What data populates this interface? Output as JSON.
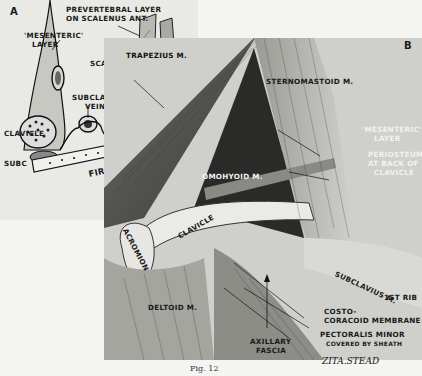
{
  "panel_a": {
    "letter": "A",
    "labels": {
      "prevertebral_1": "PREVERTEBRAL LAYER",
      "prevertebral_2": "ON SCALENUS  ANT.",
      "mesenteric_1": "'MESENTERIC'",
      "mesenteric_2": "LAYER",
      "scalenus_1": "SCALENUS",
      "scalenus_2": "MED.",
      "vein_1": "SUBCLAVIAN",
      "vein_2": "VEIN",
      "clavicle": "CLAVICLE",
      "subclavius": "SUBC",
      "first_rib": "FIRST  RIB",
      "artery": "SUBCLAVIAN A."
    }
  },
  "panel_b": {
    "letter": "B",
    "labels": {
      "trapezius": "TRAPEZIUS M.",
      "sternomastoid": "STERNOMASTOID M.",
      "omohyoid": "OMOHYOID M.",
      "mesenteric_1": "'MESENTERIC'",
      "mesenteric_2": "LAYER",
      "periosteum_1": "PERIOSTEUM",
      "periosteum_2": "AT BACK OF",
      "periosteum_3": "CLAVICLE",
      "acromion": "ACROMION",
      "clavicle": "CLAVICLE",
      "deltoid": "DELTOID M.",
      "axillary_1": "AXILLARY",
      "axillary_2": "FASCIA",
      "subclavius": "SUBCLAVIUS M.",
      "first_rib": "1ST RIB",
      "costo_1": "COSTO-",
      "costo_2": "CORACOID MEMBRANE",
      "pectoralis_1": "PECTORALIS MINOR",
      "pectoralis_2": "COVERED BY SHEATH"
    }
  },
  "signature": "ZITA.STEAD",
  "caption": "Fig. 12"
}
